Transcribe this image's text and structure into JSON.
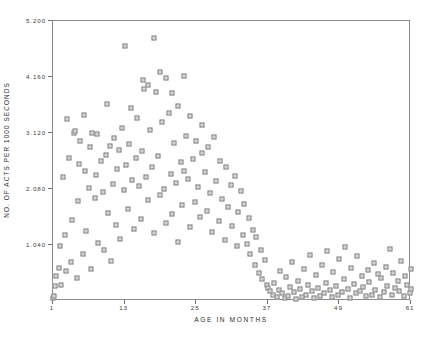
{
  "chart_data": {
    "type": "scatter",
    "title": "",
    "xlabel": "AGE IN MONTHS",
    "ylabel": "NO. OF ACTS PER 1000 SECONDS",
    "xlim": [
      1,
      61
    ],
    "ylim": [
      0,
      5.2
    ],
    "xticks": [
      1,
      13,
      25,
      37,
      49,
      61
    ],
    "xtick_labels": [
      "1",
      "13",
      "25",
      "37",
      "49",
      "61"
    ],
    "yticks": [
      1.04,
      2.08,
      3.12,
      4.16,
      5.2
    ],
    "ytick_labels": [
      "1.040",
      "2.080",
      "3.120",
      "4.160",
      "5.200"
    ],
    "grid": false,
    "legend": null,
    "marker": "square-with-dot",
    "marker_color": "#6f6f6f",
    "frame_color": "#8a8a8a",
    "background": "#ffffff",
    "series": [
      {
        "name": "acts per 1000 seconds",
        "points": [
          [
            1.0,
            0.05
          ],
          [
            1.2,
            0.1
          ],
          [
            1.3,
            0.28
          ],
          [
            1.5,
            0.46
          ],
          [
            2.0,
            0.62
          ],
          [
            2.2,
            1.02
          ],
          [
            2.4,
            0.3
          ],
          [
            2.6,
            2.3
          ],
          [
            3.0,
            1.22
          ],
          [
            3.1,
            0.55
          ],
          [
            3.4,
            3.38
          ],
          [
            3.6,
            2.66
          ],
          [
            4.0,
            0.72
          ],
          [
            4.2,
            1.5
          ],
          [
            4.5,
            3.12
          ],
          [
            4.7,
            3.16
          ],
          [
            5.0,
            0.42
          ],
          [
            5.2,
            1.86
          ],
          [
            5.4,
            2.55
          ],
          [
            5.6,
            2.98
          ],
          [
            6.0,
            0.88
          ],
          [
            6.2,
            3.46
          ],
          [
            6.4,
            2.42
          ],
          [
            6.6,
            1.3
          ],
          [
            7.0,
            2.1
          ],
          [
            7.2,
            2.86
          ],
          [
            7.4,
            0.6
          ],
          [
            7.6,
            3.12
          ],
          [
            8.0,
            1.92
          ],
          [
            8.2,
            2.34
          ],
          [
            8.4,
            3.1
          ],
          [
            8.6,
            1.08
          ],
          [
            9.0,
            2.6
          ],
          [
            9.3,
            2.02
          ],
          [
            9.5,
            0.95
          ],
          [
            9.8,
            2.72
          ],
          [
            10.0,
            3.66
          ],
          [
            10.3,
            1.64
          ],
          [
            10.5,
            2.88
          ],
          [
            10.8,
            0.74
          ],
          [
            11.0,
            2.18
          ],
          [
            11.2,
            3.02
          ],
          [
            11.5,
            1.42
          ],
          [
            11.8,
            2.46
          ],
          [
            12.0,
            2.8
          ],
          [
            12.3,
            1.16
          ],
          [
            12.6,
            3.22
          ],
          [
            12.9,
            2.06
          ],
          [
            13.0,
            4.74
          ],
          [
            13.2,
            2.52
          ],
          [
            13.5,
            1.7
          ],
          [
            13.8,
            2.92
          ],
          [
            14.0,
            3.58
          ],
          [
            14.3,
            2.24
          ],
          [
            14.6,
            1.34
          ],
          [
            14.9,
            2.66
          ],
          [
            15.0,
            3.4
          ],
          [
            15.4,
            2.14
          ],
          [
            15.7,
            1.52
          ],
          [
            15.9,
            2.78
          ],
          [
            16.0,
            4.1
          ],
          [
            16.3,
            3.94
          ],
          [
            16.6,
            2.3
          ],
          [
            16.9,
            1.88
          ],
          [
            17.0,
            4.02
          ],
          [
            17.3,
            3.18
          ],
          [
            17.6,
            2.48
          ],
          [
            17.9,
            1.26
          ],
          [
            18.0,
            4.88
          ],
          [
            18.3,
            3.88
          ],
          [
            18.6,
            2.7
          ],
          [
            18.9,
            1.96
          ],
          [
            19.0,
            4.26
          ],
          [
            19.3,
            3.32
          ],
          [
            19.6,
            2.08
          ],
          [
            19.9,
            1.44
          ],
          [
            20.0,
            4.14
          ],
          [
            20.4,
            3.5
          ],
          [
            20.7,
            2.36
          ],
          [
            20.9,
            1.62
          ],
          [
            21.0,
            3.86
          ],
          [
            21.3,
            2.94
          ],
          [
            21.6,
            2.2
          ],
          [
            21.9,
            1.1
          ],
          [
            22.0,
            3.62
          ],
          [
            22.4,
            2.58
          ],
          [
            22.7,
            1.78
          ],
          [
            22.9,
            2.42
          ],
          [
            23.0,
            4.18
          ],
          [
            23.3,
            3.06
          ],
          [
            23.6,
            2.26
          ],
          [
            23.9,
            1.38
          ],
          [
            24.0,
            3.44
          ],
          [
            24.4,
            2.64
          ],
          [
            24.8,
            1.84
          ],
          [
            25.0,
            2.98
          ],
          [
            25.3,
            2.12
          ],
          [
            25.6,
            1.56
          ],
          [
            25.9,
            2.74
          ],
          [
            26.0,
            3.26
          ],
          [
            26.4,
            2.4
          ],
          [
            26.8,
            1.68
          ],
          [
            27.0,
            2.86
          ],
          [
            27.3,
            2.0
          ],
          [
            27.7,
            1.28
          ],
          [
            28.0,
            3.04
          ],
          [
            28.4,
            2.22
          ],
          [
            28.8,
            1.48
          ],
          [
            29.0,
            2.6
          ],
          [
            29.4,
            1.9
          ],
          [
            29.8,
            1.14
          ],
          [
            30.0,
            2.48
          ],
          [
            30.4,
            1.74
          ],
          [
            30.8,
            2.16
          ],
          [
            31.0,
            1.4
          ],
          [
            31.5,
            2.32
          ],
          [
            31.9,
            1.02
          ],
          [
            32.0,
            1.66
          ],
          [
            32.5,
            2.04
          ],
          [
            32.9,
            1.22
          ],
          [
            33.0,
            1.8
          ],
          [
            33.5,
            1.06
          ],
          [
            33.9,
            1.54
          ],
          [
            34.0,
            0.88
          ],
          [
            34.5,
            1.32
          ],
          [
            34.9,
            0.66
          ],
          [
            35.0,
            1.18
          ],
          [
            35.5,
            0.52
          ],
          [
            35.9,
            0.94
          ],
          [
            36.0,
            0.4
          ],
          [
            36.5,
            0.76
          ],
          [
            36.9,
            0.3
          ],
          [
            37.0,
            0.24
          ],
          [
            37.4,
            0.18
          ],
          [
            37.8,
            0.12
          ],
          [
            38.0,
            0.34
          ],
          [
            38.5,
            0.08
          ],
          [
            38.9,
            0.2
          ],
          [
            39.0,
            0.56
          ],
          [
            39.4,
            0.14
          ],
          [
            39.8,
            0.06
          ],
          [
            40.0,
            0.44
          ],
          [
            40.4,
            0.1
          ],
          [
            40.8,
            0.26
          ],
          [
            41.0,
            0.72
          ],
          [
            41.4,
            0.16
          ],
          [
            41.8,
            0.04
          ],
          [
            42.0,
            0.38
          ],
          [
            42.4,
            0.22
          ],
          [
            42.8,
            0.08
          ],
          [
            43.0,
            0.6
          ],
          [
            43.4,
            0.12
          ],
          [
            43.8,
            0.3
          ],
          [
            44.0,
            0.86
          ],
          [
            44.4,
            0.18
          ],
          [
            44.8,
            0.06
          ],
          [
            45.0,
            0.48
          ],
          [
            45.4,
            0.24
          ],
          [
            45.8,
            0.1
          ],
          [
            46.0,
            0.66
          ],
          [
            46.4,
            0.14
          ],
          [
            46.8,
            0.34
          ],
          [
            47.0,
            0.92
          ],
          [
            47.4,
            0.2
          ],
          [
            47.8,
            0.08
          ],
          [
            48.0,
            0.54
          ],
          [
            48.4,
            0.28
          ],
          [
            48.8,
            0.12
          ],
          [
            49.0,
            0.78
          ],
          [
            49.4,
            0.16
          ],
          [
            49.8,
            0.4
          ],
          [
            50.0,
            1.0
          ],
          [
            50.4,
            0.22
          ],
          [
            50.8,
            0.06
          ],
          [
            51.0,
            0.62
          ],
          [
            51.4,
            0.32
          ],
          [
            51.8,
            0.14
          ],
          [
            52.0,
            0.84
          ],
          [
            52.4,
            0.18
          ],
          [
            52.8,
            0.46
          ],
          [
            53.0,
            0.26
          ],
          [
            53.4,
            0.1
          ],
          [
            53.8,
            0.58
          ],
          [
            54.0,
            0.36
          ],
          [
            54.4,
            0.12
          ],
          [
            54.8,
            0.7
          ],
          [
            55.0,
            0.2
          ],
          [
            55.4,
            0.5
          ],
          [
            55.8,
            0.08
          ],
          [
            56.0,
            0.42
          ],
          [
            56.4,
            0.16
          ],
          [
            56.8,
            0.64
          ],
          [
            57.0,
            0.28
          ],
          [
            57.4,
            0.96
          ],
          [
            57.8,
            0.12
          ],
          [
            58.0,
            0.52
          ],
          [
            58.4,
            0.24
          ],
          [
            58.8,
            0.38
          ],
          [
            59.0,
            0.18
          ],
          [
            59.4,
            0.74
          ],
          [
            59.8,
            0.1
          ],
          [
            60.0,
            0.46
          ],
          [
            60.4,
            0.3
          ],
          [
            60.8,
            0.14
          ],
          [
            61.0,
            0.22
          ],
          [
            61.0,
            0.6
          ]
        ]
      }
    ]
  }
}
